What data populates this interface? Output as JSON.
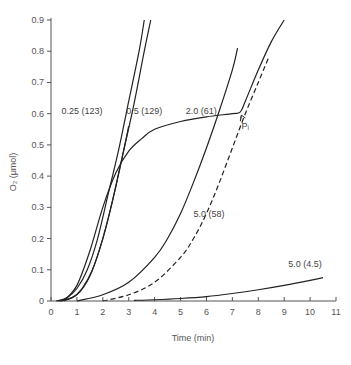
{
  "chart_data": {
    "type": "line",
    "title": "",
    "xlabel": "Time (min)",
    "ylabel": "O₂ (μmol)",
    "xlim": [
      0,
      11
    ],
    "ylim": [
      0,
      0.9
    ],
    "xticks": [
      0,
      1,
      2,
      3,
      4,
      5,
      6,
      7,
      8,
      9,
      10,
      11
    ],
    "yticks": [
      0,
      0.1,
      0.2,
      0.3,
      0.4,
      0.5,
      0.6,
      0.7,
      0.8,
      0.9
    ],
    "xtick_labels": [
      "0",
      "1",
      "2",
      "3",
      "4",
      "5",
      "6",
      "7",
      "8",
      "9",
      "10",
      "11"
    ],
    "ytick_labels": [
      "0",
      "0.1",
      "0.2",
      "0.3",
      "0.4",
      "0.5",
      "0.6",
      "0.7",
      "0.8",
      "0.9"
    ],
    "grid": false,
    "series": [
      {
        "name": "0.25 (123)",
        "style": "solid",
        "x": [
          0.2,
          0.6,
          1.0,
          1.4,
          1.8,
          2.2,
          2.6,
          3.0,
          3.4,
          3.6
        ],
        "y": [
          0,
          0.01,
          0.04,
          0.1,
          0.2,
          0.34,
          0.48,
          0.64,
          0.8,
          0.9
        ]
      },
      {
        "name": "0.5 (129)",
        "style": "solid",
        "x": [
          0.3,
          0.8,
          1.2,
          1.6,
          2.0,
          2.4,
          2.8,
          3.2,
          3.6,
          3.85
        ],
        "y": [
          0,
          0.01,
          0.04,
          0.1,
          0.2,
          0.33,
          0.48,
          0.63,
          0.8,
          0.9
        ]
      },
      {
        "name": "third steep curve",
        "style": "solid",
        "x": [
          0.4,
          1.0,
          1.5,
          2.0,
          2.4,
          2.8,
          3.0
        ],
        "y": [
          0,
          0.02,
          0.08,
          0.2,
          0.33,
          0.48,
          0.56
        ]
      },
      {
        "name": "P-limited curve",
        "style": "solid",
        "x": [
          0.5,
          1.0,
          1.5,
          2.0,
          2.5,
          3.0,
          3.5,
          4.0,
          5.0,
          6.0,
          7.0,
          7.3,
          7.5,
          8.0,
          8.5,
          9.0
        ],
        "y": [
          0,
          0.05,
          0.16,
          0.3,
          0.41,
          0.48,
          0.52,
          0.55,
          0.575,
          0.59,
          0.6,
          0.605,
          0.64,
          0.74,
          0.83,
          0.9
        ]
      },
      {
        "name": "2.0 (61)",
        "style": "solid",
        "x": [
          1.0,
          2.0,
          3.0,
          4.0,
          4.5,
          5.0,
          5.5,
          6.0,
          6.5,
          7.0,
          7.2
        ],
        "y": [
          0,
          0.02,
          0.06,
          0.14,
          0.2,
          0.28,
          0.38,
          0.49,
          0.61,
          0.74,
          0.81
        ]
      },
      {
        "name": "5.0 (58)",
        "style": "dashed",
        "x": [
          2.0,
          3.0,
          4.0,
          5.0,
          5.5,
          6.0,
          6.5,
          7.0,
          7.5,
          8.0,
          8.4
        ],
        "y": [
          0,
          0.02,
          0.06,
          0.14,
          0.2,
          0.28,
          0.38,
          0.49,
          0.6,
          0.7,
          0.78
        ]
      },
      {
        "name": "5.0 (4.5)",
        "style": "solid",
        "x": [
          3.2,
          4,
          5,
          6,
          7,
          8,
          9,
          10,
          10.5
        ],
        "y": [
          0.002,
          0.004,
          0.008,
          0.014,
          0.024,
          0.036,
          0.05,
          0.066,
          0.075
        ]
      }
    ],
    "annotations": [
      {
        "text": "0.25 (123)",
        "x": 1.2,
        "y": 0.6
      },
      {
        "text": "0.5 (129)",
        "x": 3.6,
        "y": 0.6
      },
      {
        "text": "2.0 (61)",
        "x": 5.8,
        "y": 0.6
      },
      {
        "text": "5.0 (58)",
        "x": 6.1,
        "y": 0.27
      },
      {
        "text": "5.0 (4.5)",
        "x": 9.8,
        "y": 0.11
      },
      {
        "text": "Pᵢ",
        "x": 7.5,
        "y": 0.55,
        "arrow_to": [
          7.35,
          0.605
        ]
      }
    ]
  }
}
